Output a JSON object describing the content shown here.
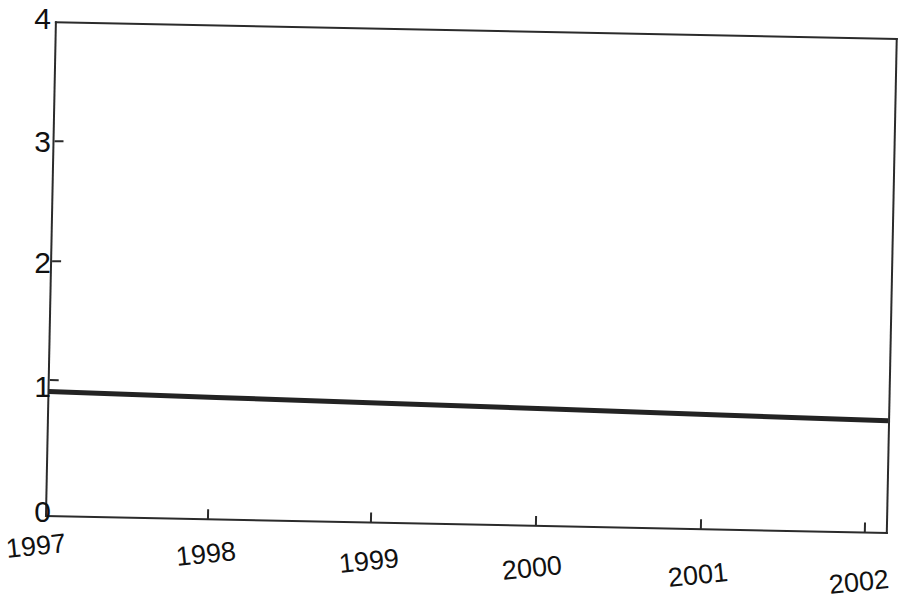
{
  "chart_data": {
    "type": "line",
    "title": "",
    "subtitle": "",
    "xlabel": "",
    "ylabel": "",
    "x": [
      "1997",
      "1998",
      "1999",
      "2000",
      "2001",
      "2002"
    ],
    "categories": [
      "1997",
      "1998",
      "1999",
      "2000",
      "2001",
      "2002"
    ],
    "series": [
      {
        "name": "index",
        "values": [
          1.0,
          0.98,
          0.96,
          0.94,
          0.92,
          0.9
        ]
      }
    ],
    "values": [
      1.0,
      0.98,
      0.96,
      0.94,
      0.92,
      0.9
    ],
    "ylim": [
      0,
      4
    ],
    "yticks": [
      0,
      1,
      2,
      3,
      4
    ],
    "ytick_labels": [
      "0",
      "1",
      "2",
      "3",
      "4"
    ],
    "xtick_labels": [
      "1997",
      "1998",
      "1999",
      "2000",
      "2001",
      "2002"
    ],
    "grid": false,
    "legend": null,
    "legend_position": "none",
    "line_color": "#232323",
    "axis_color": "#2b2b2b",
    "background_color": "#ffffff",
    "xtick_label_rotation_deg": -7,
    "annotations": []
  },
  "axes": {
    "y_tick_labels": [
      {
        "value": "4",
        "y": 20
      },
      {
        "value": "3",
        "y": 140
      },
      {
        "value": "2",
        "y": 260
      },
      {
        "value": "1",
        "y": 379
      },
      {
        "value": "0",
        "y": 499
      }
    ],
    "x_tick_labels": [
      {
        "value": "1997",
        "x": 6,
        "y": 533
      },
      {
        "value": "1998",
        "x": 175,
        "y": 541
      },
      {
        "value": "1999",
        "x": 338,
        "y": 548
      },
      {
        "value": "2000",
        "x": 500,
        "y": 556
      },
      {
        "value": "2001",
        "x": 667,
        "y": 563
      },
      {
        "value": "2002",
        "x": 828,
        "y": 569
      }
    ]
  },
  "caption": {
    "remnant_text": ""
  }
}
